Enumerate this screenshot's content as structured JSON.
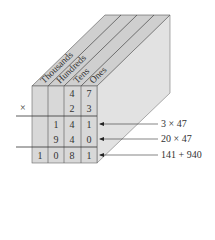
{
  "diagram": {
    "columns": [
      "Thousands",
      "Hundreds",
      "Tens",
      "Ones"
    ],
    "operator": "×",
    "rows": [
      [
        "",
        "",
        "4",
        "7"
      ],
      [
        "",
        "",
        "2",
        "3"
      ],
      [
        "",
        "1",
        "4",
        "1"
      ],
      [
        "",
        "9",
        "4",
        "0"
      ],
      [
        "1",
        "0",
        "8",
        "1"
      ]
    ],
    "annotations": [
      "3 × 47",
      "20 × 47",
      "141 + 940"
    ],
    "colors": {
      "face": "#d6d6d6",
      "top": "#c9c9c9",
      "side": "#e3e3e3",
      "edge": "#4a4a4a"
    }
  }
}
